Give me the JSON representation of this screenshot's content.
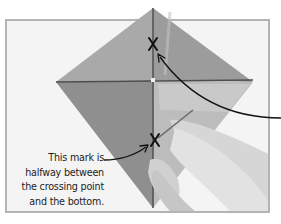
{
  "figure": {
    "marks": [
      {
        "label": "X",
        "position": "upper"
      },
      {
        "label": "X",
        "position": "lower"
      }
    ],
    "caption_lines": [
      "This mark is",
      "halfway between",
      "the crossing point",
      "and the bottom."
    ],
    "colors": {
      "background": "#ffffff",
      "frame_border": "#b4b4b4",
      "frame_fill": "#f4f4f4",
      "kite_upper_left": "#a8a8a8",
      "kite_upper_right": "#9a9a9a",
      "kite_lower_left": "#8e8e8e",
      "kite_lower_right": "#bdbdbd",
      "spar": "#555555",
      "annotation": "#111111",
      "hand": "#d4d4d4"
    }
  }
}
